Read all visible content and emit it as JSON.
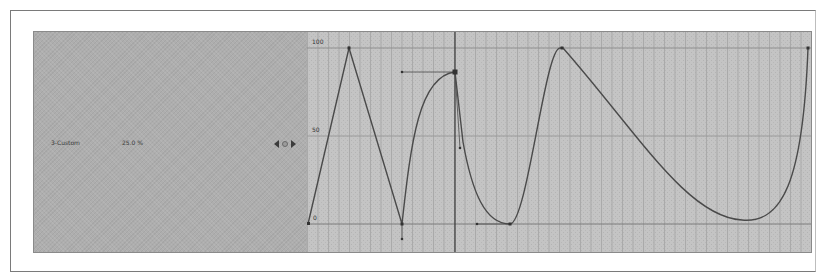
{
  "track": {
    "name": "3-Custom",
    "value": "25.0 %",
    "nav": {
      "prev_icon": "prev-key-arrow",
      "key_icon": "keyframe-toggle",
      "next_icon": "next-key-arrow"
    }
  },
  "graph": {
    "y_labels": {
      "top": "100",
      "mid": "50",
      "bottom": "0"
    },
    "colors": {
      "background": "#c2c2c2",
      "grid": "#a9a9a9",
      "curve": "#4a4a4a",
      "playhead": "#3a3a3a"
    }
  }
}
